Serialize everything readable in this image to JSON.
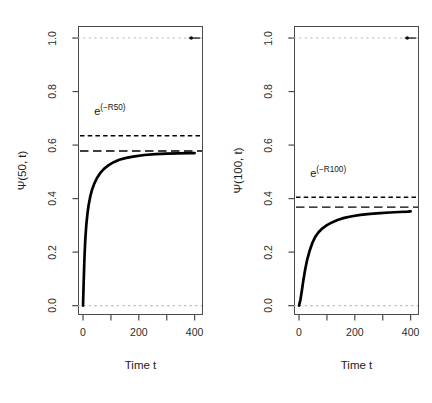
{
  "figure": {
    "width": 432,
    "height": 403,
    "background": "#ffffff",
    "panel_count": 2
  },
  "colors": {
    "curve": "#000000",
    "dashed_reference": "#000000",
    "guide_line": "#b9b9b9",
    "box_border": "#4a4a4a",
    "tick_label": "#2b2b2b",
    "axis_title": "#1c1c1c"
  },
  "axis_common": {
    "xlabel": "Time t",
    "x_ticks": [
      0,
      100,
      200,
      300,
      400
    ],
    "x_tick_labels": [
      "0",
      "",
      "200",
      "",
      "400"
    ],
    "xlim": [
      -18,
      430
    ],
    "y_ticks": [
      0.0,
      0.2,
      0.4,
      0.6,
      0.8,
      1.0
    ],
    "y_tick_labels": [
      "0.0",
      "0.2",
      "0.4",
      "0.6",
      "0.8",
      "1.0"
    ],
    "ylim": [
      -0.035,
      1.045
    ],
    "grid": false,
    "legend": "none"
  },
  "panels": [
    {
      "id": "panel-left",
      "ylabel": "Ψ(50, t)",
      "annotation": {
        "base": "e",
        "exponent": "(−R50)",
        "x": 40,
        "y": 0.735
      },
      "guide_lines": [
        {
          "name": "upper-guide-1.0",
          "y": 1.0,
          "style": "dotted",
          "color": "#b9b9b9"
        },
        {
          "name": "lower-guide-0.0",
          "y": 0.0,
          "style": "dotted",
          "color": "#b9b9b9"
        }
      ],
      "marker": {
        "name": "top-right-marker",
        "x": 388,
        "y": 1.0
      },
      "dashed_lines": [
        {
          "name": "exp-minus-R-line",
          "y": 0.635,
          "dash": "short"
        },
        {
          "name": "asymptote-line",
          "y": 0.578,
          "dash": "long"
        }
      ],
      "curve": {
        "name": "psi-50-curve",
        "asymptote": 0.57,
        "shape": "saturating-exponential",
        "x": [
          0,
          2,
          5,
          8,
          12,
          16,
          20,
          26,
          32,
          40,
          50,
          62,
          76,
          92,
          110,
          130,
          155,
          185,
          220,
          260,
          300,
          340,
          380,
          400
        ],
        "y": [
          0.0,
          0.075,
          0.175,
          0.245,
          0.305,
          0.345,
          0.375,
          0.408,
          0.432,
          0.455,
          0.477,
          0.496,
          0.512,
          0.525,
          0.536,
          0.545,
          0.552,
          0.558,
          0.563,
          0.566,
          0.568,
          0.569,
          0.57,
          0.57
        ]
      }
    },
    {
      "id": "panel-right",
      "ylabel": "Ψ(100, t)",
      "annotation": {
        "base": "e",
        "exponent": "(−R100)",
        "x": 40,
        "y": 0.505
      },
      "guide_lines": [
        {
          "name": "upper-guide-1.0",
          "y": 1.0,
          "style": "dotted",
          "color": "#b9b9b9"
        },
        {
          "name": "lower-guide-0.0",
          "y": 0.0,
          "style": "dotted",
          "color": "#b9b9b9"
        }
      ],
      "marker": {
        "name": "top-right-marker",
        "x": 388,
        "y": 1.0
      },
      "dashed_lines": [
        {
          "name": "exp-minus-R-line",
          "y": 0.405,
          "dash": "short"
        },
        {
          "name": "asymptote-line",
          "y": 0.368,
          "dash": "long"
        }
      ],
      "curve": {
        "name": "psi-100-curve",
        "asymptote": 0.352,
        "shape": "sigmoidal-saturating",
        "x": [
          0,
          5,
          10,
          16,
          22,
          30,
          38,
          48,
          58,
          70,
          84,
          100,
          118,
          138,
          162,
          190,
          220,
          255,
          290,
          325,
          360,
          390,
          400
        ],
        "y": [
          0.0,
          0.022,
          0.055,
          0.098,
          0.135,
          0.175,
          0.205,
          0.235,
          0.257,
          0.274,
          0.289,
          0.301,
          0.311,
          0.32,
          0.328,
          0.334,
          0.339,
          0.343,
          0.346,
          0.348,
          0.35,
          0.351,
          0.352
        ]
      }
    }
  ],
  "chart_data": {
    "type": "line",
    "title": "",
    "subtitle": "",
    "xlabel": "Time t",
    "ylabel": "Ψ(R, t)",
    "xlim": [
      0,
      400
    ],
    "ylim": [
      0.0,
      1.0
    ],
    "grid": false,
    "legend": "none",
    "x_tick_labels": [
      "0",
      "200",
      "400"
    ],
    "y_tick_labels": [
      "0.0",
      "0.2",
      "0.4",
      "0.6",
      "0.8",
      "1.0"
    ],
    "panels": [
      {
        "panel_label": "Ψ(50, t)",
        "annotation": "e^(−R50)",
        "series": [
          {
            "name": "Ψ(50, t)",
            "style": "solid",
            "x": [
              0,
              2,
              5,
              8,
              12,
              16,
              20,
              26,
              32,
              40,
              50,
              62,
              76,
              92,
              110,
              130,
              155,
              185,
              220,
              260,
              300,
              340,
              380,
              400
            ],
            "values": [
              0.0,
              0.075,
              0.175,
              0.245,
              0.305,
              0.345,
              0.375,
              0.408,
              0.432,
              0.455,
              0.477,
              0.496,
              0.512,
              0.525,
              0.536,
              0.545,
              0.552,
              0.558,
              0.563,
              0.566,
              0.568,
              0.569,
              0.57,
              0.57
            ]
          }
        ],
        "hlines": [
          {
            "label": "e^(−R50)",
            "value": 0.635,
            "style": "short-dashed"
          },
          {
            "label": "asymptote",
            "value": 0.578,
            "style": "long-dashed"
          },
          {
            "label": "upper bound",
            "value": 1.0,
            "style": "dotted-gray"
          },
          {
            "label": "lower bound",
            "value": 0.0,
            "style": "dotted-gray"
          }
        ]
      },
      {
        "panel_label": "Ψ(100, t)",
        "annotation": "e^(−R100)",
        "series": [
          {
            "name": "Ψ(100, t)",
            "style": "solid",
            "x": [
              0,
              5,
              10,
              16,
              22,
              30,
              38,
              48,
              58,
              70,
              84,
              100,
              118,
              138,
              162,
              190,
              220,
              255,
              290,
              325,
              360,
              390,
              400
            ],
            "values": [
              0.0,
              0.022,
              0.055,
              0.098,
              0.135,
              0.175,
              0.205,
              0.235,
              0.257,
              0.274,
              0.289,
              0.301,
              0.311,
              0.32,
              0.328,
              0.334,
              0.339,
              0.343,
              0.346,
              0.348,
              0.35,
              0.351,
              0.352
            ]
          }
        ],
        "hlines": [
          {
            "label": "e^(−R100)",
            "value": 0.405,
            "style": "short-dashed"
          },
          {
            "label": "asymptote",
            "value": 0.368,
            "style": "long-dashed"
          },
          {
            "label": "upper bound",
            "value": 1.0,
            "style": "dotted-gray"
          },
          {
            "label": "lower bound",
            "value": 0.0,
            "style": "dotted-gray"
          }
        ]
      }
    ]
  }
}
